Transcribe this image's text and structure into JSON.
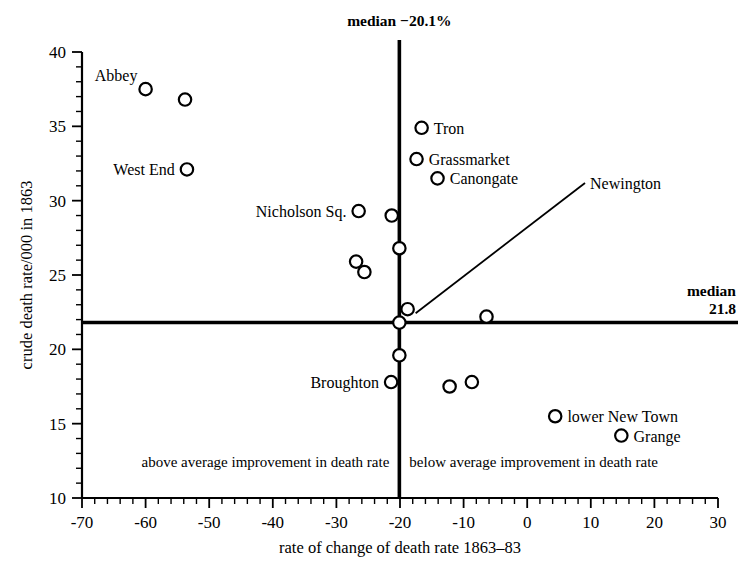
{
  "chart_data": {
    "type": "scatter",
    "title": "",
    "xlabel": "rate of change of death rate 1863–83",
    "ylabel": "crude death rate/000 in 1863",
    "xlim": [
      -70,
      30
    ],
    "ylim": [
      10,
      40
    ],
    "xticks": [
      -70,
      -60,
      -50,
      -40,
      -30,
      -20,
      -10,
      0,
      10,
      20,
      30
    ],
    "xtick_labels": [
      "-70",
      "-60",
      "-50",
      "-40",
      "-30",
      "-20",
      "-10",
      "0",
      "10",
      "20",
      "30"
    ],
    "yticks": [
      10,
      15,
      20,
      25,
      30,
      35,
      40
    ],
    "ytick_labels": [
      "10",
      "15",
      "20",
      "25",
      "30",
      "35",
      "40"
    ],
    "x_minor_step": 2,
    "y_minor_step": 1,
    "grid": false,
    "legend": "none",
    "points": [
      {
        "label": "Abbey",
        "x": -60.0,
        "y": 37.5,
        "label_pos": "left-above"
      },
      {
        "label": "",
        "x": -53.8,
        "y": 36.8,
        "label_pos": "none"
      },
      {
        "label": "West End",
        "x": -53.5,
        "y": 32.1,
        "label_pos": "left"
      },
      {
        "label": "Nicholson Sq.",
        "x": -26.5,
        "y": 29.3,
        "label_pos": "left"
      },
      {
        "label": "",
        "x": -21.3,
        "y": 29.0,
        "label_pos": "none"
      },
      {
        "label": "",
        "x": -20.1,
        "y": 26.8,
        "label_pos": "none"
      },
      {
        "label": "",
        "x": -26.9,
        "y": 25.9,
        "label_pos": "none"
      },
      {
        "label": "",
        "x": -25.6,
        "y": 25.2,
        "label_pos": "none"
      },
      {
        "label": "Tron",
        "x": -16.6,
        "y": 34.9,
        "label_pos": "right"
      },
      {
        "label": "Grassmarket",
        "x": -17.4,
        "y": 32.8,
        "label_pos": "right"
      },
      {
        "label": "Canongate",
        "x": -14.1,
        "y": 31.5,
        "label_pos": "right"
      },
      {
        "label": "Newington",
        "x": -18.8,
        "y": 22.7,
        "label_pos": "leader"
      },
      {
        "label": "",
        "x": -20.1,
        "y": 21.8,
        "label_pos": "none"
      },
      {
        "label": "",
        "x": -6.4,
        "y": 22.2,
        "label_pos": "none"
      },
      {
        "label": "",
        "x": -20.1,
        "y": 19.6,
        "label_pos": "none"
      },
      {
        "label": "Broughton",
        "x": -21.4,
        "y": 17.8,
        "label_pos": "left"
      },
      {
        "label": "",
        "x": -12.2,
        "y": 17.5,
        "label_pos": "none"
      },
      {
        "label": "",
        "x": -8.7,
        "y": 17.8,
        "label_pos": "none"
      },
      {
        "label": "lower New Town",
        "x": 4.4,
        "y": 15.5,
        "label_pos": "right"
      },
      {
        "label": "Grange",
        "x": 14.8,
        "y": 14.2,
        "label_pos": "right"
      }
    ],
    "median_x": {
      "value": -20.1,
      "label_line1": "median −20.1%"
    },
    "median_y": {
      "value": 21.8,
      "label_line1": "median",
      "label_line2": "21.8"
    },
    "quadrant_labels": {
      "left": "above average improvement in death rate",
      "right": "below average improvement in death rate"
    },
    "colors": {
      "axis": "#000000",
      "marker_stroke": "#000000",
      "marker_fill": "#ffffff",
      "background": "#ffffff"
    }
  }
}
